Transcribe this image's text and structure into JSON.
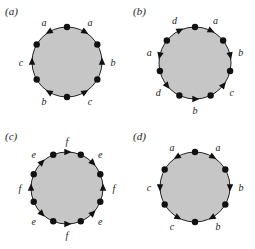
{
  "figure": {
    "fill_color": "#c6c6c6",
    "stroke_color": "#222222",
    "vertex_color": "#111111",
    "panels": [
      {
        "id": "a",
        "label": "(a)",
        "origin": [
          0,
          0
        ],
        "center": [
          67,
          62
        ],
        "radius": 35,
        "points": [
          {
            "type": "dot"
          },
          {
            "type": "arrow",
            "label": "a",
            "dir": "cw"
          },
          {
            "type": "dot"
          },
          {
            "type": "arrow",
            "label": "b",
            "dir": "ccw"
          },
          {
            "type": "dot"
          },
          {
            "type": "arrow",
            "label": "c",
            "dir": "ccw"
          },
          {
            "type": "dot"
          },
          {
            "type": "arrow",
            "label": "b",
            "dir": "cw"
          },
          {
            "type": "dot"
          },
          {
            "type": "arrow",
            "label": "c",
            "dir": "cw"
          },
          {
            "type": "dot"
          },
          {
            "type": "arrow",
            "label": "a",
            "dir": "ccw"
          }
        ]
      },
      {
        "id": "b",
        "label": "(b)",
        "origin": [
          128,
          0
        ],
        "center": [
          67,
          63
        ],
        "radius": 36,
        "points": [
          {
            "type": "dot"
          },
          {
            "type": "arrow",
            "label": "a",
            "dir": "cw"
          },
          {
            "type": "dot"
          },
          {
            "type": "arrow",
            "label": "b",
            "dir": "cw"
          },
          {
            "type": "dot"
          },
          {
            "type": "arrow",
            "label": "c",
            "dir": "ccw"
          },
          {
            "type": "dot"
          },
          {
            "type": "arrow",
            "label": "b",
            "dir": "ccw"
          },
          {
            "type": "dot"
          },
          {
            "type": "arrow",
            "label": "d",
            "dir": "ccw"
          },
          {
            "type": "dot"
          },
          {
            "type": "arrow",
            "label": "a",
            "dir": "ccw"
          },
          {
            "type": "dot"
          },
          {
            "type": "arrow",
            "label": "d",
            "dir": "cw"
          }
        ]
      },
      {
        "id": "c",
        "label": "(c)",
        "origin": [
          0,
          125
        ],
        "center": [
          67,
          63
        ],
        "radius": 36,
        "points": [
          {
            "type": "arrow",
            "label": "f",
            "dir": "cw"
          },
          {
            "type": "dot"
          },
          {
            "type": "arrow",
            "label": "e",
            "dir": "cw"
          },
          {
            "type": "dot"
          },
          {
            "type": "arrow",
            "label": "f",
            "dir": "ccw"
          },
          {
            "type": "dot"
          },
          {
            "type": "arrow",
            "label": "e",
            "dir": "ccw"
          },
          {
            "type": "dot"
          },
          {
            "type": "arrow",
            "label": "f",
            "dir": "ccw"
          },
          {
            "type": "dot"
          },
          {
            "type": "arrow",
            "label": "e",
            "dir": "ccw"
          },
          {
            "type": "dot"
          },
          {
            "type": "arrow",
            "label": "f",
            "dir": "cw"
          },
          {
            "type": "dot"
          },
          {
            "type": "arrow",
            "label": "e",
            "dir": "cw"
          },
          {
            "type": "dot"
          }
        ]
      },
      {
        "id": "d",
        "label": "(d)",
        "origin": [
          128,
          125
        ],
        "center": [
          67,
          62
        ],
        "radius": 35,
        "points": [
          {
            "type": "dot"
          },
          {
            "type": "arrow",
            "label": "a",
            "dir": "cw"
          },
          {
            "type": "dot"
          },
          {
            "type": "arrow",
            "label": "b",
            "dir": "cw"
          },
          {
            "type": "dot"
          },
          {
            "type": "arrow",
            "label": "b",
            "dir": "cw"
          },
          {
            "type": "dot"
          },
          {
            "type": "arrow",
            "label": "c",
            "dir": "ccw"
          },
          {
            "type": "dot"
          },
          {
            "type": "arrow",
            "label": "c",
            "dir": "ccw"
          },
          {
            "type": "dot"
          },
          {
            "type": "arrow",
            "label": "a",
            "dir": "ccw"
          }
        ]
      }
    ]
  }
}
